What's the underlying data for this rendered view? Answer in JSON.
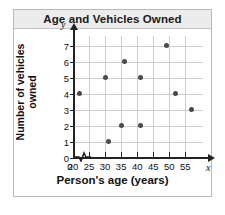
{
  "card": {
    "title": "Age and Vehicles Owned"
  },
  "chart_data": {
    "type": "scatter",
    "title": "Age and Vehicles Owned",
    "xlabel": "Person's age (years)",
    "ylabel": "Number of vehicles\nowned",
    "grid": true,
    "legend": null,
    "xlim": [
      20,
      58
    ],
    "ylim": [
      0,
      7.6
    ],
    "x_axis_letter": "x",
    "y_axis_letter": "y",
    "x_axis_break": true,
    "x_origin_label": "0",
    "xticks": [
      20,
      25,
      30,
      35,
      40,
      45,
      50,
      55
    ],
    "xtick_labels": [
      "20",
      "25",
      "30",
      "35",
      "40",
      "45",
      "50",
      "55"
    ],
    "yticks": [
      0,
      1,
      2,
      3,
      4,
      5,
      6,
      7
    ],
    "ytick_labels": [
      "0",
      "1",
      "2",
      "3",
      "4",
      "5",
      "6",
      "7"
    ],
    "point_color": "#4a4a4a",
    "grid_color": "#cfcfcf",
    "points": [
      {
        "x": 22,
        "y": 4
      },
      {
        "x": 30,
        "y": 5
      },
      {
        "x": 31,
        "y": 1
      },
      {
        "x": 35,
        "y": 2
      },
      {
        "x": 36,
        "y": 6
      },
      {
        "x": 41,
        "y": 2
      },
      {
        "x": 41,
        "y": 5
      },
      {
        "x": 49,
        "y": 7
      },
      {
        "x": 52,
        "y": 4
      },
      {
        "x": 57,
        "y": 3
      }
    ]
  }
}
